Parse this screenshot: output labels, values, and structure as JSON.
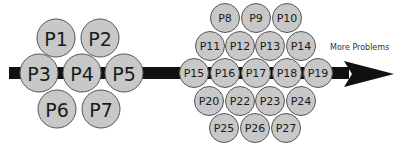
{
  "colors": {
    "arrow": "#111111",
    "circle_fill": "#c8c8c8",
    "circle_stroke": "#555555",
    "label": "#1a1a1a",
    "background": "#ffffff"
  },
  "arrow": {
    "bar": {
      "x": 9,
      "y": 67,
      "width": 340,
      "height": 12
    },
    "head": {
      "base_x": 344,
      "top_y": 61,
      "bottom_y": 87,
      "tip_x": 394,
      "tip_y": 74
    }
  },
  "annotation": {
    "text": "More Problems",
    "x": 330,
    "y": 50
  },
  "groups": [
    {
      "name": "initial-problems",
      "radius": 19,
      "font_size": 19,
      "items": [
        {
          "label": "P1",
          "cx": 56,
          "cy": 38
        },
        {
          "label": "P2",
          "cx": 100,
          "cy": 38
        },
        {
          "label": "P3",
          "cx": 39,
          "cy": 73
        },
        {
          "label": "P4",
          "cx": 82,
          "cy": 73
        },
        {
          "label": "P5",
          "cx": 124,
          "cy": 73
        },
        {
          "label": "P6",
          "cx": 57,
          "cy": 109
        },
        {
          "label": "P7",
          "cx": 101,
          "cy": 109
        }
      ]
    },
    {
      "name": "more-problems",
      "radius": 14.5,
      "font_size": 11,
      "items": [
        {
          "label": "P8",
          "cx": 225,
          "cy": 18
        },
        {
          "label": "P9",
          "cx": 256,
          "cy": 18
        },
        {
          "label": "P10",
          "cx": 287,
          "cy": 18
        },
        {
          "label": "P11",
          "cx": 210,
          "cy": 46
        },
        {
          "label": "P12",
          "cx": 240,
          "cy": 46
        },
        {
          "label": "P13",
          "cx": 270,
          "cy": 46
        },
        {
          "label": "P14",
          "cx": 301,
          "cy": 46
        },
        {
          "label": "P15",
          "cx": 194,
          "cy": 73
        },
        {
          "label": "P16",
          "cx": 225,
          "cy": 73
        },
        {
          "label": "P17",
          "cx": 256,
          "cy": 73
        },
        {
          "label": "P18",
          "cx": 287,
          "cy": 73
        },
        {
          "label": "P19",
          "cx": 318,
          "cy": 73
        },
        {
          "label": "P20",
          "cx": 209,
          "cy": 101
        },
        {
          "label": "P22",
          "cx": 240,
          "cy": 101
        },
        {
          "label": "P23",
          "cx": 270,
          "cy": 101
        },
        {
          "label": "P24",
          "cx": 301,
          "cy": 101
        },
        {
          "label": "P25",
          "cx": 224,
          "cy": 128
        },
        {
          "label": "P26",
          "cx": 255,
          "cy": 128
        },
        {
          "label": "P27",
          "cx": 286,
          "cy": 128
        }
      ]
    }
  ]
}
